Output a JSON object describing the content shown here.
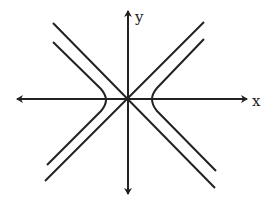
{
  "diagram": {
    "type": "hyperbola with asymptotes",
    "axes": {
      "x_label": "x",
      "y_label": "y"
    },
    "colors": {
      "stroke": "#222222",
      "background": "#ffffff"
    },
    "elements": [
      "x-axis",
      "y-axis",
      "asymptote y=x",
      "asymptote y=-x",
      "left hyperbola branch",
      "right hyperbola branch"
    ]
  }
}
